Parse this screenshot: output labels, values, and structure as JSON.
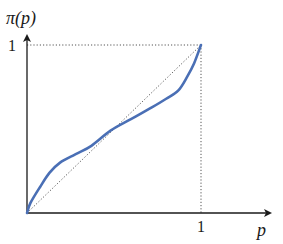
{
  "chart_data": {
    "type": "line",
    "title": "",
    "xlabel": "p",
    "ylabel": "π(p)",
    "xlim": [
      0,
      1
    ],
    "ylim": [
      0,
      1
    ],
    "x_ticks": [
      "1"
    ],
    "y_ticks": [
      "1"
    ],
    "grid": false,
    "legend": null,
    "series": [
      {
        "name": "π(p) probability weighting function",
        "style": "solid",
        "color": "#4a6fb5",
        "x": [
          0,
          0.02,
          0.075,
          0.13,
          0.19,
          0.28,
          0.37,
          0.48,
          0.6,
          0.72,
          0.8,
          0.87,
          0.92,
          0.96,
          1.0
        ],
        "y": [
          0,
          0.06,
          0.155,
          0.24,
          0.3,
          0.35,
          0.4,
          0.49,
          0.56,
          0.63,
          0.68,
          0.73,
          0.81,
          0.89,
          1.0
        ]
      },
      {
        "name": "diagonal π(p) = p",
        "style": "dotted",
        "color": "#444444",
        "x": [
          0,
          1
        ],
        "y": [
          0,
          1
        ]
      }
    ],
    "reference_lines": [
      {
        "type": "horizontal",
        "y": 1,
        "from_x": 0,
        "to_x": 1,
        "style": "dotted"
      },
      {
        "type": "vertical",
        "x": 1,
        "from_y": 0,
        "to_y": 1,
        "style": "dotted"
      }
    ]
  },
  "labels": {
    "y_axis": "π(p)",
    "x_axis": "p",
    "y_tick_one": "1",
    "x_tick_one": "1"
  },
  "colors": {
    "curve": "#4a6fb5",
    "axes": "#1a1a1a",
    "dotted": "#555555"
  }
}
